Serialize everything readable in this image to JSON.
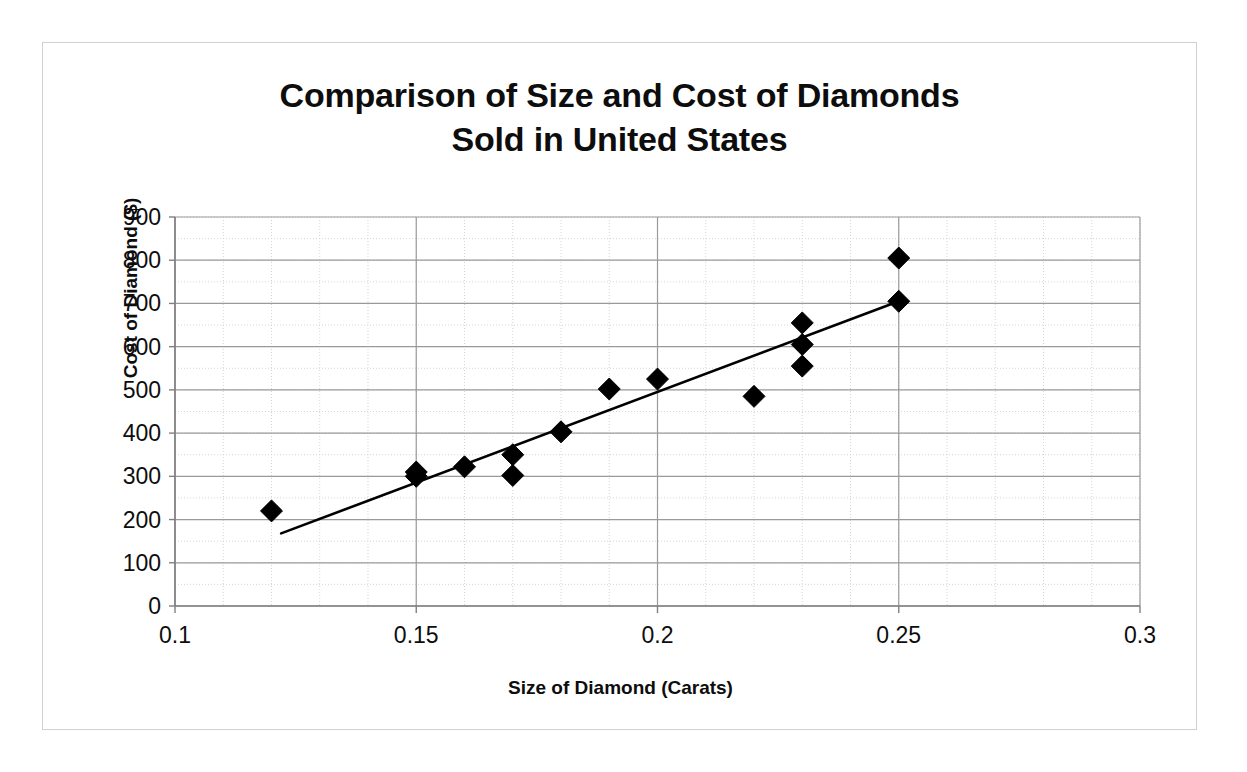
{
  "chart_data": {
    "type": "scatter",
    "title": "Comparison of Size and Cost of Diamonds\nSold in United States",
    "xlabel": "Size of Diamond (Carats)",
    "ylabel": "Cost of Diamond ($)",
    "xlim": [
      0.1,
      0.3
    ],
    "ylim": [
      0,
      900
    ],
    "x_ticks": [
      0.1,
      0.15,
      0.2,
      0.25,
      0.3
    ],
    "x_tick_labels": [
      "0.1",
      "0.15",
      "0.2",
      "0.25",
      "0.3"
    ],
    "y_ticks": [
      0,
      100,
      200,
      300,
      400,
      500,
      600,
      700,
      800,
      900
    ],
    "y_tick_labels": [
      "0",
      "100",
      "200",
      "300",
      "400",
      "500",
      "600",
      "700",
      "800",
      "900"
    ],
    "x_minor_step": 0.01,
    "y_minor_step": 50,
    "grid": true,
    "legend": false,
    "marker": "diamond",
    "marker_color": "#000000",
    "points": [
      {
        "x": 0.12,
        "y": 220
      },
      {
        "x": 0.15,
        "y": 310
      },
      {
        "x": 0.15,
        "y": 300
      },
      {
        "x": 0.16,
        "y": 322
      },
      {
        "x": 0.17,
        "y": 350
      },
      {
        "x": 0.17,
        "y": 302
      },
      {
        "x": 0.18,
        "y": 403
      },
      {
        "x": 0.19,
        "y": 502
      },
      {
        "x": 0.2,
        "y": 525
      },
      {
        "x": 0.22,
        "y": 485
      },
      {
        "x": 0.23,
        "y": 655
      },
      {
        "x": 0.23,
        "y": 605
      },
      {
        "x": 0.23,
        "y": 555
      },
      {
        "x": 0.25,
        "y": 805
      },
      {
        "x": 0.25,
        "y": 705
      }
    ],
    "trendline": {
      "label": "linear trend line",
      "color": "#000000",
      "x_start": 0.122,
      "y_start": 168,
      "x_end": 0.25,
      "y_end": 705
    }
  },
  "colors": {
    "background": "#ffffff",
    "frame_border": "#d0d0d0",
    "text": "#0d0d0d",
    "axis_line": "#808080",
    "major_grid": "#9a9a9a",
    "minor_grid": "#d5d5d5",
    "marker": "#000000",
    "trendline": "#000000"
  }
}
